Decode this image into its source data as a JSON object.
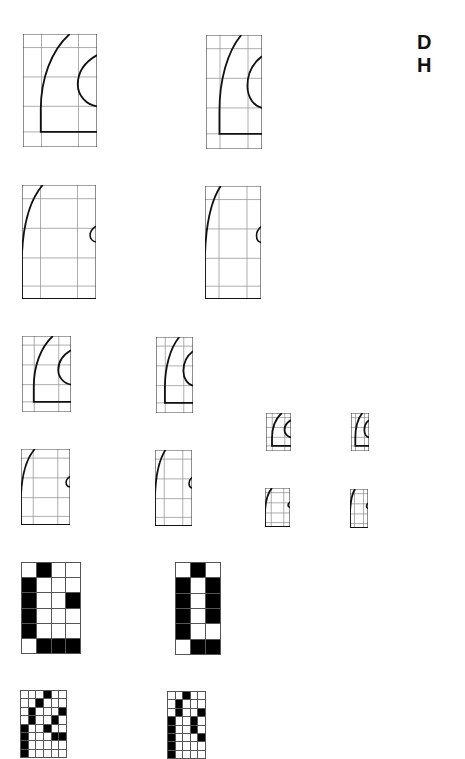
{
  "labels": {
    "line1": "D",
    "line2": "H"
  },
  "figures": {
    "outline_large_wide": {
      "description": "glyph outline on grid, large, wide"
    },
    "outline_large_narrow": {
      "description": "glyph outline on grid, large, narrow"
    },
    "outline_tall_wide": {
      "description": "glyph outline on grid, tall, wide"
    },
    "outline_tall_narrow": {
      "description": "glyph outline on grid, tall, narrow"
    }
  },
  "bitmaps": {
    "large_wide": {
      "cols": 4,
      "rows": 6,
      "cells": [
        [
          0,
          1,
          0,
          0
        ],
        [
          1,
          0,
          0,
          0
        ],
        [
          1,
          0,
          0,
          1
        ],
        [
          1,
          0,
          0,
          0
        ],
        [
          1,
          0,
          0,
          0
        ],
        [
          0,
          1,
          1,
          1
        ]
      ]
    },
    "large_narrow": {
      "cols": 3,
      "rows": 6,
      "cells": [
        [
          0,
          1,
          0
        ],
        [
          1,
          0,
          1
        ],
        [
          1,
          0,
          1
        ],
        [
          1,
          0,
          1
        ],
        [
          1,
          0,
          0
        ],
        [
          0,
          1,
          1
        ]
      ]
    },
    "small_wide": {
      "cols": 6,
      "rows": 8,
      "cells": [
        [
          0,
          0,
          0,
          1,
          0,
          0
        ],
        [
          0,
          0,
          1,
          0,
          0,
          0
        ],
        [
          0,
          1,
          0,
          0,
          0,
          1
        ],
        [
          0,
          1,
          0,
          0,
          1,
          0
        ],
        [
          1,
          0,
          0,
          1,
          0,
          0
        ],
        [
          1,
          0,
          0,
          0,
          1,
          1
        ],
        [
          1,
          0,
          0,
          0,
          0,
          0
        ],
        [
          1,
          0,
          0,
          0,
          0,
          0
        ]
      ]
    },
    "small_narrow": {
      "cols": 5,
      "rows": 8,
      "cells": [
        [
          0,
          0,
          1,
          0,
          0
        ],
        [
          0,
          1,
          0,
          0,
          0
        ],
        [
          0,
          1,
          0,
          0,
          1
        ],
        [
          1,
          0,
          0,
          1,
          0
        ],
        [
          1,
          0,
          0,
          1,
          0
        ],
        [
          1,
          0,
          0,
          0,
          1
        ],
        [
          1,
          0,
          0,
          0,
          0
        ],
        [
          1,
          0,
          0,
          0,
          0
        ]
      ]
    }
  }
}
